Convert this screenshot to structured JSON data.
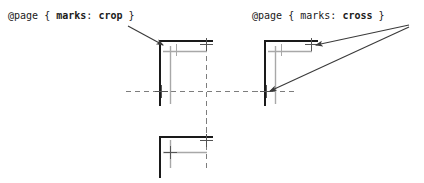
{
  "figure": {
    "background_color": "#ffffff",
    "width": 424,
    "height": 183
  },
  "captions": {
    "crop": {
      "full_text": "@page { marks: crop }",
      "at_rule": "@page",
      "brace_open": "{",
      "property": "marks",
      "colon": ":",
      "value": "crop",
      "brace_close": "}"
    },
    "cross": {
      "full_text": "@page { marks: cross }",
      "at_rule": "@page",
      "brace_open": "{",
      "property": "marks",
      "colon": ":",
      "value": "cross",
      "brace_close": "}"
    }
  },
  "colors": {
    "crop_mark_line": "#1a1a1a",
    "page_box_line": "#a8a8a8",
    "center_dash_line": "#7d7d7d",
    "cross_mark": "#555555",
    "arrow": "#3a3a3a",
    "text": "#1a1a1a"
  },
  "diagrams": [
    {
      "id": "crop-diagram-top",
      "label": "crop marks example, top-left page corner",
      "crop_marks": [
        "horizontal-top",
        "vertical-left"
      ],
      "cross_marks": 2,
      "arrows": 1,
      "arrow_target": "crop-mark-corner"
    },
    {
      "id": "cross-diagram",
      "label": "cross marks example, top-left page corner",
      "crop_marks": [
        "horizontal-top",
        "vertical-left"
      ],
      "cross_marks": 2,
      "arrows": 2,
      "arrow_target": "cross-marks"
    },
    {
      "id": "crop-diagram-bottom",
      "label": "crop marks example, bottom page corner",
      "crop_marks": [
        "horizontal-bottom",
        "vertical-left"
      ],
      "cross_marks": 2,
      "arrows": 0,
      "arrow_target": ""
    }
  ]
}
